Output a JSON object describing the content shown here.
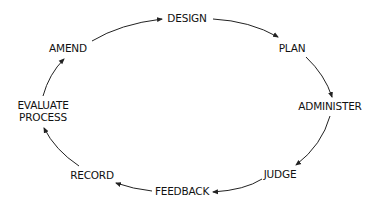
{
  "diagram": {
    "type": "cycle",
    "direction": "clockwise",
    "colors": {
      "text": "#111111",
      "arrow": "#222222",
      "background": "#ffffff"
    },
    "nodes": [
      {
        "id": "design",
        "label": "DESIGN"
      },
      {
        "id": "plan",
        "label": "PLAN"
      },
      {
        "id": "administer",
        "label": "ADMINISTER"
      },
      {
        "id": "judge",
        "label": "JUDGE"
      },
      {
        "id": "feedback",
        "label": "FEEDBACK"
      },
      {
        "id": "record",
        "label": "RECORD"
      },
      {
        "id": "evaluate-process",
        "label_line1": "EVALUATE",
        "label_line2": "PROCESS"
      },
      {
        "id": "amend",
        "label": "AMEND"
      }
    ],
    "edges": [
      {
        "from": "design",
        "to": "plan"
      },
      {
        "from": "plan",
        "to": "administer"
      },
      {
        "from": "administer",
        "to": "judge"
      },
      {
        "from": "judge",
        "to": "feedback"
      },
      {
        "from": "feedback",
        "to": "record"
      },
      {
        "from": "record",
        "to": "evaluate-process"
      },
      {
        "from": "evaluate-process",
        "to": "amend"
      },
      {
        "from": "amend",
        "to": "design"
      }
    ]
  }
}
